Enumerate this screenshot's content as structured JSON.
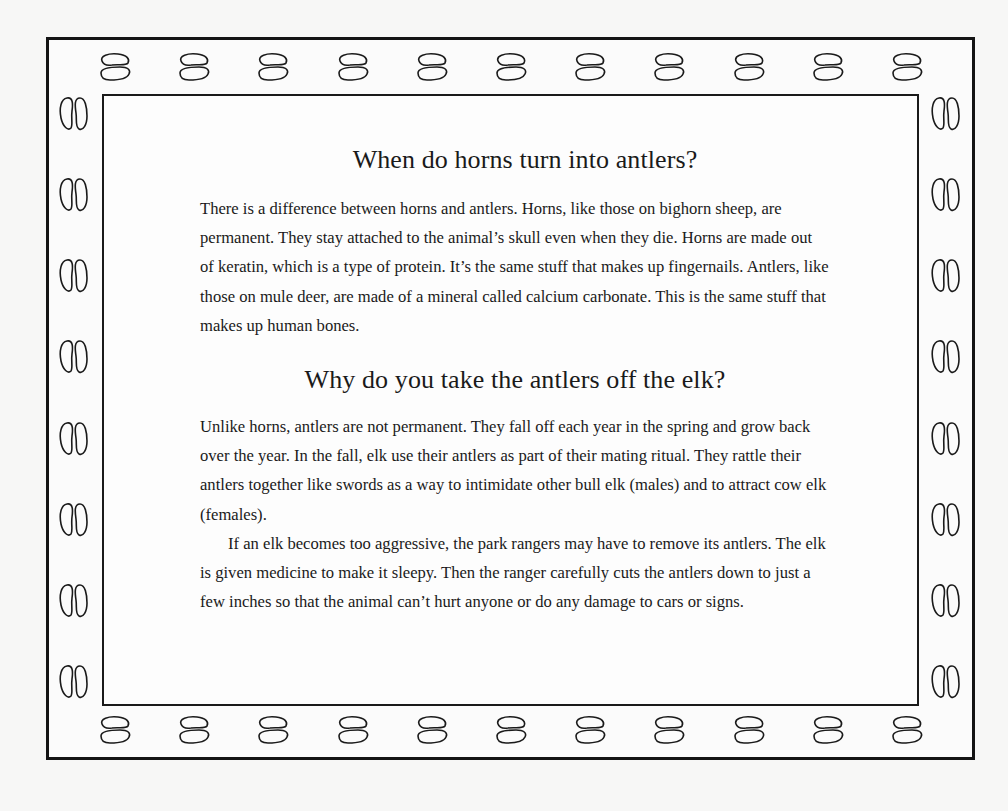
{
  "document": {
    "section1": {
      "heading": "When do horns turn into antlers?",
      "paragraphs": [
        "There is a difference between horns and antlers. Horns, like those on bighorn sheep, are permanent. They stay attached to the animal’s skull even when they die. Horns are made out of keratin, which is a type of protein. It’s the same stuff that makes up fingernails. Antlers, like those on mule deer, are made of a mineral called calcium carbonate. This is the same stuff that makes up human bones."
      ]
    },
    "section2": {
      "heading": "Why do you take the antlers off the elk?",
      "paragraphs": [
        "Unlike horns, antlers are not permanent. They fall off each year in the spring and grow back over the year. In the fall, elk use their antlers as part of their mating ritual. They rattle their antlers together like swords as a way to intimidate other bull elk (males) and to attract cow elk (females).",
        "If an elk becomes too aggressive, the park rangers may have to remove its antlers. The elk is given medicine to make it sleepy. Then the ranger carefully cuts the antlers down to just a few inches so that the animal can’t hurt anyone or do any damage to cars or signs."
      ]
    }
  },
  "border": {
    "icon": "hoofprint-icon",
    "top_count": 11,
    "bottom_count": 11,
    "left_count": 8,
    "right_count": 8,
    "stroke_color": "#1a1a1a"
  }
}
